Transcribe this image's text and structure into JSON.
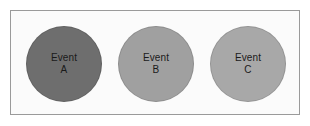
{
  "diagram": {
    "frame": {
      "border_color": "#9a9a9a",
      "background_color": "#fbfbfb"
    },
    "nodes": [
      {
        "id": "event-a",
        "name_line": "Event",
        "id_line": "A",
        "fill_color": "#6e6e6e",
        "text_color": "#1a1a1a"
      },
      {
        "id": "event-b",
        "name_line": "Event",
        "id_line": "B",
        "fill_color": "#a0a0a0",
        "text_color": "#1a1a1a"
      },
      {
        "id": "event-c",
        "name_line": "Event",
        "id_line": "C",
        "fill_color": "#a8a8a8",
        "text_color": "#1a1a1a"
      }
    ]
  }
}
